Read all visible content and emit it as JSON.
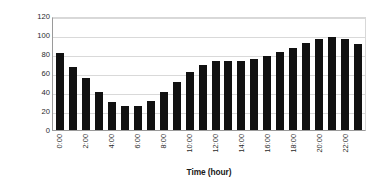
{
  "chart_data": {
    "type": "bar",
    "title": "",
    "xlabel": "Time (hour)",
    "ylabel": "% of Busy Hour Load",
    "ylim": [
      0,
      120
    ],
    "yticks": [
      120,
      100,
      80,
      60,
      40,
      20,
      0
    ],
    "grid": true,
    "legend": "none",
    "bar_color": "#111111",
    "categories": [
      "0:00",
      "1:00",
      "2:00",
      "3:00",
      "4:00",
      "5:00",
      "6:00",
      "7:00",
      "8:00",
      "9:00",
      "10:00",
      "11:00",
      "12:00",
      "13:00",
      "14:00",
      "15:00",
      "16:00",
      "17:00",
      "18:00",
      "19:00",
      "20:00",
      "21:00",
      "22:00",
      "23:00"
    ],
    "tick_labels": [
      "0:00",
      "",
      "2:00",
      "",
      "4:00",
      "",
      "6:00",
      "",
      "8:00",
      "",
      "10:00",
      "",
      "12:00",
      "",
      "14:00",
      "",
      "16:00",
      "",
      "18:00",
      "",
      "20:00",
      "",
      "22:00",
      ""
    ],
    "values": [
      81,
      66,
      55,
      40,
      29,
      25,
      25,
      31,
      40,
      51,
      61,
      68,
      73,
      73,
      73,
      75,
      78,
      82,
      86,
      92,
      96,
      98,
      96,
      91
    ]
  }
}
